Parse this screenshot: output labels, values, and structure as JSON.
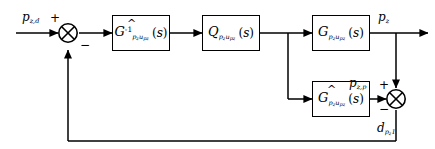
{
  "diagram": {
    "line_color": "#000000",
    "block_fill": "#ffffff"
  },
  "signals": {
    "reference": {
      "base": "p",
      "sub": "z,d",
      "name": "desired-pressure-reference"
    },
    "output": {
      "base": "p",
      "sub": "z",
      "name": "plant-output-pressure"
    },
    "model_output": {
      "base": "p",
      "sub": "z,p",
      "name": "model-predicted-pressure"
    },
    "disturbance": {
      "base": "d",
      "sub": "p",
      "subsub": "z",
      "suffix": "1",
      "name": "estimated-disturbance"
    }
  },
  "blocks": [
    {
      "id": "inverse-model",
      "symbol": "G",
      "hat": "^",
      "superscript": "-1",
      "sub_main": "p",
      "sub_sub1": "z",
      "sub_mid": "u",
      "sub_sub2": "p",
      "sub_sub3": "z",
      "arg": "s"
    },
    {
      "id": "q-filter",
      "symbol": "Q",
      "hat": "",
      "superscript": "",
      "sub_main": "p",
      "sub_sub1": "z",
      "sub_mid": "u",
      "sub_sub2": "p",
      "sub_sub3": "z",
      "arg": "s"
    },
    {
      "id": "plant",
      "symbol": "G",
      "hat": "",
      "superscript": "",
      "sub_main": "p",
      "sub_sub1": "z",
      "sub_mid": "u",
      "sub_sub2": "p",
      "sub_sub3": "z",
      "arg": "s"
    },
    {
      "id": "plant-model",
      "symbol": "G",
      "hat": "^",
      "superscript": "",
      "sub_main": "p",
      "sub_sub1": "z",
      "sub_mid": "u",
      "sub_sub2": "p",
      "sub_sub3": "z",
      "arg": "s"
    }
  ],
  "junctions": {
    "left": {
      "name": "error-summing-junction",
      "plus": "+",
      "minus": "−"
    },
    "right": {
      "name": "disturbance-summing-junction",
      "plus": "+",
      "minus": "−"
    }
  },
  "parens": {
    "open": "(",
    "close": ")"
  }
}
